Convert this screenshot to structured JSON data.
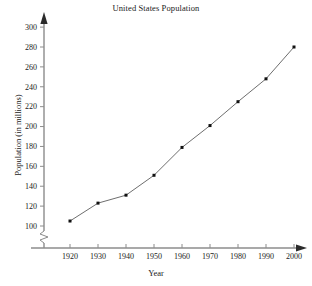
{
  "chart_data": {
    "type": "line",
    "title": "United States Population",
    "xlabel": "Year",
    "ylabel": "Population (in millions)",
    "x": [
      1920,
      1930,
      1940,
      1950,
      1960,
      1970,
      1980,
      1990,
      2000
    ],
    "values": [
      105,
      123,
      131,
      151,
      179,
      201,
      225,
      248,
      280
    ],
    "xtick_labels": [
      "1920",
      "1930",
      "1940",
      "1950",
      "1960",
      "1970",
      "1980",
      "1990",
      "2000"
    ],
    "ytick_labels": [
      "100",
      "120",
      "140",
      "160",
      "180",
      "200",
      "220",
      "240",
      "260",
      "280",
      "300"
    ],
    "yticks": [
      100,
      120,
      140,
      160,
      180,
      200,
      220,
      240,
      260,
      280,
      300
    ],
    "xlim": [
      1915,
      2005
    ],
    "ylim": [
      100,
      300
    ],
    "grid": false,
    "legend": "none",
    "y_axis_break": true,
    "marker": "square",
    "line_color": "#6e6e6e",
    "marker_color": "#111111",
    "axis_color": "#8c8c8c"
  }
}
